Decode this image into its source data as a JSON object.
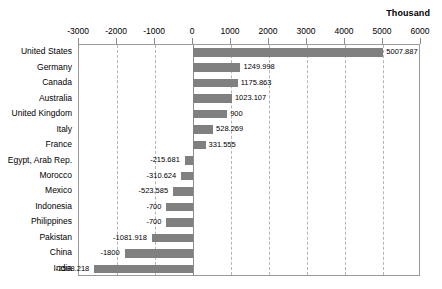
{
  "chart_data": {
    "type": "bar",
    "orientation": "horizontal",
    "title": "",
    "subtitle": "",
    "unit_caption": "Thousand",
    "xlabel": "",
    "ylabel": "",
    "xlim": [
      -3000,
      6000
    ],
    "grid": true,
    "legend": false,
    "bar_color": "#808080",
    "xticks": [
      -3000,
      -2000,
      -1000,
      0,
      1000,
      2000,
      3000,
      4000,
      5000,
      6000
    ],
    "xtick_labels": [
      "-3000",
      "-2000",
      "-1000",
      "0",
      "1000",
      "2000",
      "3000",
      "4000",
      "5000",
      "6000"
    ],
    "categories": [
      "United States",
      "Germany",
      "Canada",
      "Australia",
      "United Kingdom",
      "Italy",
      "France",
      "Egypt, Arab Rep.",
      "Morocco",
      "Mexico",
      "Indonesia",
      "Philippines",
      "Pakistan",
      "China",
      "India"
    ],
    "values": [
      5007.887,
      1249.998,
      1175.863,
      1023.107,
      900,
      528.269,
      331.555,
      -215.681,
      -310.624,
      -523.585,
      -700,
      -700,
      -1081.918,
      -1800,
      -2598.218
    ],
    "value_labels": [
      "5007.887",
      "1249.998",
      "1175.863",
      "1023.107",
      "900",
      "528.269",
      "331.555",
      "-215.681",
      "-310.624",
      "-523.585",
      "-700",
      "-700",
      "-1081.918",
      "-1800",
      "-2598.218"
    ]
  }
}
